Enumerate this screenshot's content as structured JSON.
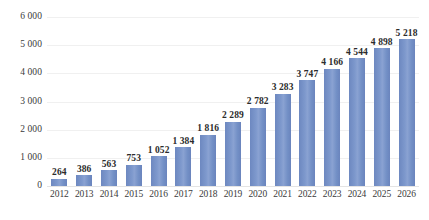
{
  "chart_data": {
    "type": "bar",
    "title": "",
    "subtitle": "",
    "xlabel": "",
    "ylabel": "",
    "categories": [
      "2012",
      "2013",
      "2014",
      "2015",
      "2016",
      "2017",
      "2018",
      "2019",
      "2020",
      "2021",
      "2022",
      "2023",
      "2024",
      "2025",
      "2026"
    ],
    "values": [
      264,
      386,
      563,
      753,
      1052,
      1384,
      1816,
      2289,
      2782,
      3283,
      3747,
      4166,
      4544,
      4898,
      5218
    ],
    "value_labels": [
      "264",
      "386",
      "563",
      "753",
      "1 052",
      "1 384",
      "1 816",
      "2 289",
      "2 782",
      "3 283",
      "3 747",
      "4 166",
      "4 544",
      "4 898",
      "5 218"
    ],
    "ylim": [
      0,
      6000
    ],
    "ytick_values": [
      0,
      1000,
      2000,
      3000,
      4000,
      5000,
      6000
    ],
    "ytick_labels": [
      "0",
      "1 000",
      "2 000",
      "3 000",
      "4 000",
      "5 000",
      "6 000"
    ],
    "grid": true,
    "legend": false,
    "legend_position": "none",
    "series": [
      {
        "name": "",
        "values": [
          264,
          386,
          563,
          753,
          1052,
          1384,
          1816,
          2289,
          2782,
          3283,
          3747,
          4166,
          4544,
          4898,
          5218
        ]
      }
    ],
    "colors": {
      "bar": "#7e99cd",
      "bar_edge_left": "#6d88c0",
      "bar_edge_right": "#6a84bd",
      "gridline": "#f0f0f0",
      "baseline": "#e4e4e4",
      "axis_text": "#3a3a3a",
      "label_text": "#2b2b2b",
      "background": "#ffffff"
    }
  }
}
